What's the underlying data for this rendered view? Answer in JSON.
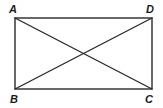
{
  "diagram": {
    "type": "geometry",
    "shape": "rectangle",
    "stroke_color": "#2a2a2a",
    "vertices": [
      {
        "name": "A",
        "x": 15,
        "y": 18,
        "label_x": 9,
        "label_y": 13
      },
      {
        "name": "D",
        "x": 152,
        "y": 18,
        "label_x": 146,
        "label_y": 13
      },
      {
        "name": "B",
        "x": 15,
        "y": 89,
        "label_x": 10,
        "label_y": 103
      },
      {
        "name": "C",
        "x": 152,
        "y": 89,
        "label_x": 145,
        "label_y": 103
      }
    ],
    "sides": [
      {
        "name": "AD",
        "from": "A",
        "to": "D"
      },
      {
        "name": "DC",
        "from": "D",
        "to": "C"
      },
      {
        "name": "CB",
        "from": "C",
        "to": "B"
      },
      {
        "name": "BA",
        "from": "B",
        "to": "A"
      }
    ],
    "diagonals": [
      {
        "name": "AC",
        "from": "A",
        "to": "C"
      },
      {
        "name": "BD",
        "from": "B",
        "to": "D"
      }
    ],
    "labels": {
      "A": "A",
      "B": "B",
      "C": "C",
      "D": "D"
    }
  }
}
